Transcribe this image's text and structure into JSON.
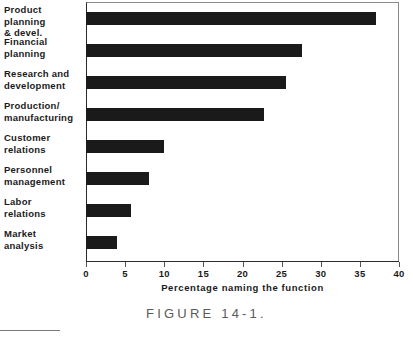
{
  "chart_data": {
    "type": "bar",
    "orientation": "horizontal",
    "title": "",
    "xlabel": "Percentage naming the function",
    "ylabel": "",
    "xlim": [
      0,
      40
    ],
    "xticks": [
      0,
      5,
      10,
      15,
      20,
      25,
      30,
      35,
      40
    ],
    "xtick_labels": [
      "0",
      "5",
      "10",
      "15",
      "20",
      "25",
      "30",
      "35",
      "40"
    ],
    "grid": false,
    "legend": null,
    "bar_color": "#1a1a1a",
    "categories": [
      "Product planning\n& devel.",
      "Financial\nplanning",
      "Research and\ndevelopment",
      "Production/\nmanufacturing",
      "Customer\nrelations",
      "Personnel\nmanagement",
      "Labor\nrelations",
      "Market\nanalysis"
    ],
    "values": [
      37.0,
      27.6,
      25.5,
      22.7,
      10.0,
      8.0,
      5.7,
      4.0
    ]
  },
  "caption": {
    "figure_label": "FIGURE   14-1."
  },
  "footer": {
    "smudge_text": ""
  }
}
